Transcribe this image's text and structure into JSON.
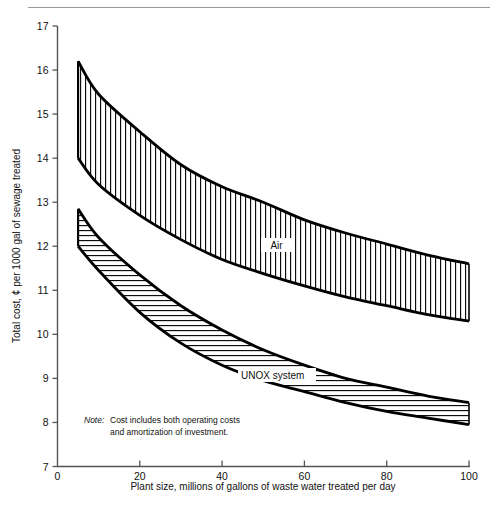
{
  "figure": {
    "background": "#ffffff",
    "line_color": "#000000",
    "axis_color": "#555555",
    "rule_color": "#9a9a9a"
  },
  "chart_data": {
    "type": "area",
    "title": "",
    "subtitle": "",
    "xlabel": "Plant size, millions of gallons of waste water treated per day",
    "ylabel": "Total cost, ¢ per 1000 gal of sewage treated",
    "xlim": [
      0,
      100
    ],
    "ylim": [
      7,
      17
    ],
    "xticks": [
      0,
      20,
      40,
      60,
      80,
      100
    ],
    "xtick_labels": [
      "0",
      "20",
      "40",
      "60",
      "80",
      "100"
    ],
    "yticks": [
      7,
      8,
      9,
      10,
      11,
      12,
      13,
      14,
      15,
      16,
      17
    ],
    "ytick_labels": [
      "7",
      "8",
      "9",
      "10",
      "11",
      "12",
      "13",
      "14",
      "15",
      "16",
      "17"
    ],
    "grid": false,
    "legend": "inline curve labels",
    "x": [
      5,
      10,
      20,
      30,
      40,
      50,
      60,
      70,
      80,
      90,
      100
    ],
    "series": [
      {
        "name": "Air",
        "label": "Air",
        "hatch": "vertical",
        "upper": [
          16.2,
          15.45,
          14.6,
          13.85,
          13.35,
          13.0,
          12.6,
          12.3,
          12.05,
          11.8,
          11.6
        ],
        "lower": [
          14.0,
          13.4,
          12.7,
          12.15,
          11.7,
          11.38,
          11.1,
          10.85,
          10.65,
          10.45,
          10.3
        ]
      },
      {
        "name": "UNOX system",
        "label": "UNOX system",
        "hatch": "horizontal",
        "upper": [
          12.85,
          12.2,
          11.35,
          10.65,
          10.1,
          9.65,
          9.3,
          9.0,
          8.8,
          8.6,
          8.45
        ],
        "lower": [
          12.0,
          11.45,
          10.5,
          9.8,
          9.3,
          8.95,
          8.7,
          8.45,
          8.25,
          8.1,
          7.95
        ]
      }
    ],
    "annotations": [
      {
        "name": "note",
        "prefix": "Note:",
        "line1": "Cost includes both operating costs",
        "line2": "and amortization of investment."
      }
    ]
  }
}
